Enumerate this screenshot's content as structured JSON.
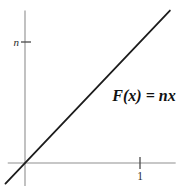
{
  "page": {
    "background": "#ffffff"
  },
  "chart_data": {
    "type": "line",
    "title": "",
    "xlabel": "",
    "ylabel": "",
    "annotation": "F(x) = nx",
    "grid": false,
    "legend": false,
    "xlim": [
      -0.15,
      1.31
    ],
    "ylim": [
      -0.19,
      1.26
    ],
    "x_ticks": [
      {
        "value": 1,
        "label": "1"
      }
    ],
    "y_ticks": [
      {
        "value": 1,
        "label": "n"
      }
    ],
    "series": [
      {
        "name": "F(x) = nx",
        "x": [
          -0.17,
          1.26
        ],
        "y": [
          -0.17,
          1.26
        ],
        "color": "#1c1c1c"
      }
    ],
    "colors": {
      "axis": "#8f8f8f",
      "tick": "#4a4a4a",
      "line": "#1c1c1c",
      "text": "#111111"
    }
  }
}
